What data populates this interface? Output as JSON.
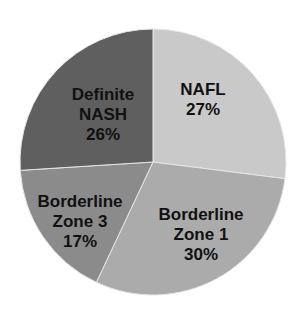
{
  "chart_data": {
    "type": "pie",
    "title": "",
    "categories": [
      "NAFL",
      "Borderline Zone 1",
      "Borderline Zone 3",
      "Definite NASH"
    ],
    "values": [
      27,
      30,
      17,
      26
    ],
    "unit": "%",
    "start_angle_deg": 0,
    "direction": "clockwise",
    "legend": "none",
    "slices": [
      {
        "name": "NAFL",
        "label_lines": [
          "NAFL",
          "27%"
        ],
        "value": 27,
        "color": "#c9c9c9",
        "label_pos": [
          203,
          100
        ]
      },
      {
        "name": "Borderline Zone 1",
        "label_lines": [
          "Borderline",
          "Zone 1",
          "30%"
        ],
        "value": 30,
        "color": "#ababab",
        "label_pos": [
          201,
          235
        ]
      },
      {
        "name": "Borderline Zone 3",
        "label_lines": [
          "Borderline",
          "Zone 3",
          "17%"
        ],
        "value": 17,
        "color": "#8b8b8b",
        "label_pos": [
          80,
          222
        ]
      },
      {
        "name": "Definite NASH",
        "label_lines": [
          "Definite",
          "NASH",
          "26%"
        ],
        "value": 26,
        "color": "#5f5f5f",
        "label_pos": [
          103,
          115
        ]
      }
    ]
  },
  "layout": {
    "center": [
      153,
      162
    ],
    "radius": 133,
    "separator_color": "#e6e6e6"
  }
}
